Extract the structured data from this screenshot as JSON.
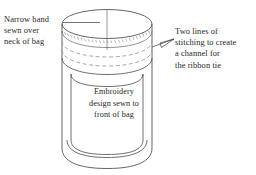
{
  "figure": {
    "kind": "line-drawing-diagram",
    "background_color": "#ffffff",
    "line_color": "#4a4a4a",
    "stitch_color": "#8a8a8a",
    "text_color": "#1f1f1f"
  },
  "annotations": {
    "left": {
      "name": "narrow-band-label",
      "lines": [
        "Narrow band",
        "sewn over",
        "neck of bag"
      ],
      "leader": "horizontal line to top of band"
    },
    "right": {
      "name": "stitching-channel-label",
      "lines": [
        "Two lines of",
        "stitching to create",
        "a channel for",
        "the ribbon tie"
      ],
      "leader": "arrow pointing left to stitch lines"
    },
    "center": {
      "name": "embroidery-panel-label",
      "lines": [
        "Embroidery",
        "design sewn to",
        "front of bag"
      ]
    }
  },
  "parts": [
    {
      "name": "top-rim-ellipse",
      "label": "bag opening"
    },
    {
      "name": "center-vertical-line",
      "label": "center fold line"
    },
    {
      "name": "gathered-band",
      "label": "narrow band over neck"
    },
    {
      "name": "stitch-line-upper",
      "label": "upper line of stitching"
    },
    {
      "name": "stitch-line-lower",
      "label": "lower line of stitching"
    },
    {
      "name": "bag-body",
      "label": "cylindrical bag body"
    },
    {
      "name": "bag-base",
      "label": "rounded bag base"
    },
    {
      "name": "front-panel",
      "label": "embroidered front panel"
    }
  ]
}
